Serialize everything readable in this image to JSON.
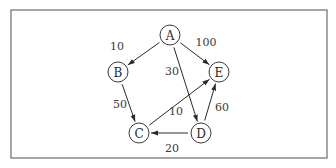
{
  "diagram": {
    "type": "directed-weighted-graph",
    "colors": {
      "frame": "#8a8a8a",
      "stroke": "#2a2a2a",
      "text": "#2a2a2a",
      "background": "#ffffff"
    },
    "nodes": [
      {
        "id": "A",
        "label": "A",
        "x": 170,
        "y": 35
      },
      {
        "id": "B",
        "label": "B",
        "x": 118,
        "y": 72
      },
      {
        "id": "C",
        "label": "C",
        "x": 139,
        "y": 133
      },
      {
        "id": "D",
        "label": "D",
        "x": 201,
        "y": 133
      },
      {
        "id": "E",
        "label": "E",
        "x": 219,
        "y": 72
      }
    ],
    "edges": [
      {
        "from": "A",
        "to": "B",
        "weight": "10",
        "lx": 117,
        "ly": 46
      },
      {
        "from": "A",
        "to": "E",
        "weight": "100",
        "lx": 206,
        "ly": 42
      },
      {
        "from": "A",
        "to": "D",
        "weight": "30",
        "lx": 172,
        "ly": 71
      },
      {
        "from": "B",
        "to": "C",
        "weight": "50",
        "lx": 120,
        "ly": 104
      },
      {
        "from": "C",
        "to": "E",
        "weight": "10",
        "lx": 176,
        "ly": 111
      },
      {
        "from": "D",
        "to": "C",
        "weight": "20",
        "lx": 172,
        "ly": 148
      },
      {
        "from": "D",
        "to": "E",
        "weight": "60",
        "lx": 222,
        "ly": 107
      }
    ]
  }
}
